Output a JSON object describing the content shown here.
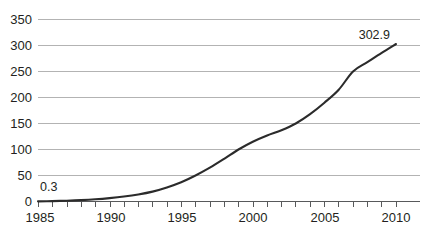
{
  "chart_data": {
    "type": "line",
    "title": "",
    "subtitle": "",
    "xlabel": "",
    "ylabel": "",
    "xlim": [
      1985,
      2010
    ],
    "ylim": [
      0,
      350
    ],
    "grid": true,
    "legend": "none",
    "y_ticks": [
      0,
      50,
      100,
      150,
      200,
      250,
      300,
      350
    ],
    "y_tick_labels": [
      "0",
      "50",
      "100",
      "150",
      "200",
      "250",
      "300",
      "350"
    ],
    "x_ticks": [
      1985,
      1990,
      1995,
      2000,
      2005,
      2010
    ],
    "x_tick_labels": [
      "1985",
      "1990",
      "1995",
      "2000",
      "2005",
      "2010"
    ],
    "x_minor_tick_interval": 1,
    "x": [
      1985,
      1986,
      1987,
      1988,
      1989,
      1990,
      1991,
      1992,
      1993,
      1994,
      1995,
      1996,
      1997,
      1998,
      1999,
      2000,
      2001,
      2002,
      2003,
      2004,
      2005,
      2006,
      2007,
      2008,
      2009,
      2010
    ],
    "values": [
      0.3,
      0.8,
      1.5,
      2.6,
      4.2,
      6.5,
      9.5,
      13.5,
      19,
      27,
      37,
      50,
      65,
      82,
      100,
      115,
      127,
      137,
      150,
      168,
      190,
      215,
      250,
      268,
      286,
      302.9
    ],
    "annotations": [
      {
        "name": "first-point-label",
        "text": "0.3",
        "x": 1985,
        "y": 0.3
      },
      {
        "name": "last-point-label",
        "text": "302.9",
        "x": 2010,
        "y": 302.9
      }
    ],
    "colors": {
      "line": "#2b2b2b",
      "gridline": "#b3b3b3",
      "axis": "#58595b",
      "text": "#231f20",
      "background": "#ffffff"
    }
  }
}
